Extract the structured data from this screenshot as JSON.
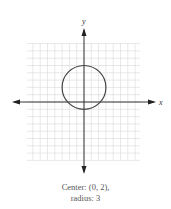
{
  "chart_data": {
    "type": "line",
    "title": "",
    "xlabel": "x",
    "ylabel": "y",
    "grid": true,
    "xlim": [
      -8,
      8
    ],
    "ylim": [
      -8,
      8
    ],
    "shape": "circle",
    "center": [
      0,
      2
    ],
    "radius": 3,
    "caption": [
      "Center: (0, 2),",
      "radius: 3"
    ]
  },
  "colors": {
    "grid": "#d8d8d8",
    "axis": "#333333",
    "curve": "#444444",
    "caption": "#555555"
  },
  "layout": {
    "origin_px": [
      84,
      102
    ],
    "unit_px": 7.3,
    "grid_left": 27,
    "grid_right": 140,
    "grid_top": 43,
    "grid_bottom": 160
  }
}
